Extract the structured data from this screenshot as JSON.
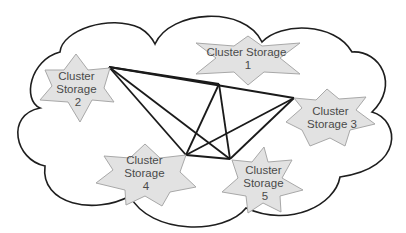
{
  "diagram": {
    "type": "network-topology",
    "container": {
      "shape": "cloud",
      "label": ""
    },
    "nodes": [
      {
        "id": "s1",
        "lines": [
          "Cluster Storage",
          "1"
        ],
        "label": "Cluster Storage 1"
      },
      {
        "id": "s2",
        "lines": [
          "Cluster",
          "Storage",
          "2"
        ],
        "label": "Cluster Storage 2"
      },
      {
        "id": "s3",
        "lines": [
          "Cluster",
          "Storage 3"
        ],
        "label": "Cluster Storage 3"
      },
      {
        "id": "s4",
        "lines": [
          "Cluster",
          "Storage",
          "4"
        ],
        "label": "Cluster Storage 4"
      },
      {
        "id": "s5",
        "lines": [
          "Cluster",
          "Storage",
          "5"
        ],
        "label": "Cluster Storage 5"
      }
    ],
    "edges": [
      [
        "s2",
        "s1"
      ],
      [
        "s2",
        "s3"
      ],
      [
        "s2",
        "s4"
      ],
      [
        "s2",
        "s5"
      ],
      [
        "s1",
        "s4"
      ],
      [
        "s1",
        "s5"
      ],
      [
        "s3",
        "s4"
      ],
      [
        "s3",
        "s5"
      ],
      [
        "s4",
        "s5"
      ]
    ],
    "topology": "full-mesh",
    "colors": {
      "node_fill": "#e2e2e2",
      "node_stroke": "#a8a8a8",
      "link": "#1a1a1a",
      "cloud_stroke": "#1e1e1e",
      "text": "#4a4a4a"
    }
  }
}
